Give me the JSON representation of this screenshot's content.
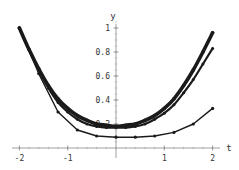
{
  "chart_data": {
    "type": "line",
    "title": "",
    "xlabel": "t",
    "ylabel": "y",
    "xlim": [
      -2,
      2
    ],
    "ylim": [
      0,
      1
    ],
    "x_ticks": [
      -2,
      -1,
      1,
      2
    ],
    "x_tick_labels": [
      "-2",
      "-1",
      "1",
      "2"
    ],
    "y_ticks": [
      0.2,
      0.4,
      0.6,
      0.8,
      1
    ],
    "y_tick_labels": [
      "0.2",
      "0.4",
      "0.6",
      "0.8",
      "1"
    ],
    "grid": false,
    "legend": null,
    "series": [
      {
        "name": "fine-approximation-thick",
        "style": "thick line with dense markers",
        "x": [
          -2.0,
          -1.8,
          -1.6,
          -1.4,
          -1.2,
          -1.0,
          -0.8,
          -0.6,
          -0.4,
          -0.2,
          0.0,
          0.2,
          0.4,
          0.6,
          0.8,
          1.0,
          1.2,
          1.4,
          1.6,
          1.8,
          2.0
        ],
        "values": [
          1.0,
          0.82,
          0.66,
          0.52,
          0.41,
          0.33,
          0.27,
          0.23,
          0.2,
          0.19,
          0.18,
          0.19,
          0.2,
          0.23,
          0.27,
          0.33,
          0.41,
          0.52,
          0.65,
          0.8,
          0.96
        ]
      },
      {
        "name": "medium-approximation",
        "style": "line with markers",
        "x": [
          -2.0,
          -1.8,
          -1.6,
          -1.4,
          -1.2,
          -1.0,
          -0.8,
          -0.6,
          -0.4,
          -0.2,
          0.0,
          0.2,
          0.4,
          0.6,
          0.8,
          1.0,
          1.2,
          1.4,
          1.6,
          1.8,
          2.0
        ],
        "values": [
          1.0,
          0.82,
          0.65,
          0.5,
          0.38,
          0.3,
          0.24,
          0.2,
          0.18,
          0.17,
          0.17,
          0.17,
          0.18,
          0.2,
          0.24,
          0.29,
          0.36,
          0.46,
          0.57,
          0.7,
          0.83
        ]
      },
      {
        "name": "coarse-approximation",
        "style": "thin line with markers",
        "x": [
          -2.0,
          -1.6,
          -1.2,
          -0.8,
          -0.4,
          0.0,
          0.4,
          0.8,
          1.2,
          1.6,
          2.0
        ],
        "values": [
          1.0,
          0.62,
          0.3,
          0.15,
          0.1,
          0.09,
          0.09,
          0.1,
          0.13,
          0.2,
          0.33
        ]
      }
    ]
  }
}
